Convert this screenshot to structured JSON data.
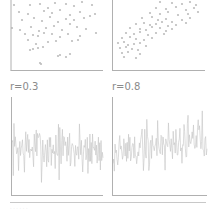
{
  "chart_data": [
    {
      "type": "scatter",
      "panel": "top-left",
      "title": "",
      "correlation_label": "r=0.3",
      "xlabel": "",
      "ylabel": "",
      "grid": false,
      "marker_color": "#bdbdbd",
      "axis_color": "#b0b0b0",
      "points": [
        [
          14,
          5
        ],
        [
          30,
          5
        ],
        [
          40,
          4
        ],
        [
          48,
          8
        ],
        [
          55,
          3
        ],
        [
          66,
          4
        ],
        [
          74,
          6
        ],
        [
          82,
          2
        ],
        [
          92,
          5
        ],
        [
          19,
          12
        ],
        [
          28,
          14
        ],
        [
          44,
          11
        ],
        [
          52,
          13
        ],
        [
          60,
          10
        ],
        [
          70,
          15
        ],
        [
          80,
          12
        ],
        [
          90,
          16
        ],
        [
          22,
          20
        ],
        [
          34,
          18
        ],
        [
          42,
          21
        ],
        [
          50,
          17
        ],
        [
          58,
          22
        ],
        [
          66,
          19
        ],
        [
          74,
          20
        ],
        [
          84,
          18
        ],
        [
          95,
          14
        ],
        [
          12,
          28
        ],
        [
          20,
          30
        ],
        [
          31,
          27
        ],
        [
          39,
          31
        ],
        [
          46,
          28
        ],
        [
          54,
          26
        ],
        [
          62,
          30
        ],
        [
          70,
          24
        ],
        [
          77,
          27
        ],
        [
          86,
          29
        ],
        [
          96,
          33
        ],
        [
          25,
          34
        ],
        [
          33,
          35
        ],
        [
          38,
          36
        ],
        [
          44,
          33
        ],
        [
          52,
          34
        ],
        [
          60,
          37
        ],
        [
          68,
          34
        ],
        [
          80,
          36
        ],
        [
          28,
          40
        ],
        [
          36,
          44
        ],
        [
          48,
          42
        ],
        [
          56,
          41
        ],
        [
          72,
          41
        ],
        [
          78,
          40
        ],
        [
          33,
          49
        ],
        [
          38,
          48
        ],
        [
          43,
          47
        ],
        [
          30,
          50
        ],
        [
          60,
          55
        ],
        [
          66,
          57
        ],
        [
          70,
          54
        ],
        [
          58,
          56
        ],
        [
          41,
          64
        ],
        [
          40,
          63
        ]
      ]
    },
    {
      "type": "scatter",
      "panel": "top-right",
      "title": "",
      "correlation_label": "r=0.8",
      "xlabel": "",
      "ylabel": "",
      "grid": false,
      "marker_color": "#bdbdbd",
      "axis_color": "#b0b0b0",
      "points": [
        [
          160,
          2
        ],
        [
          172,
          3
        ],
        [
          182,
          4
        ],
        [
          190,
          2
        ],
        [
          196,
          5
        ],
        [
          156,
          8
        ],
        [
          166,
          9
        ],
        [
          176,
          7
        ],
        [
          186,
          10
        ],
        [
          194,
          8
        ],
        [
          150,
          13
        ],
        [
          160,
          14
        ],
        [
          168,
          12
        ],
        [
          178,
          15
        ],
        [
          188,
          14
        ],
        [
          198,
          12
        ],
        [
          142,
          18
        ],
        [
          152,
          17
        ],
        [
          158,
          20
        ],
        [
          166,
          19
        ],
        [
          172,
          22
        ],
        [
          182,
          20
        ],
        [
          190,
          18
        ],
        [
          136,
          24
        ],
        [
          144,
          23
        ],
        [
          150,
          25
        ],
        [
          156,
          24
        ],
        [
          162,
          22
        ],
        [
          168,
          26
        ],
        [
          176,
          25
        ],
        [
          186,
          23
        ],
        [
          130,
          28
        ],
        [
          140,
          29
        ],
        [
          146,
          30
        ],
        [
          152,
          27
        ],
        [
          160,
          28
        ],
        [
          166,
          31
        ],
        [
          172,
          29
        ],
        [
          126,
          33
        ],
        [
          134,
          34
        ],
        [
          140,
          32
        ],
        [
          148,
          35
        ],
        [
          156,
          33
        ],
        [
          164,
          34
        ],
        [
          122,
          38
        ],
        [
          130,
          37
        ],
        [
          136,
          39
        ],
        [
          144,
          40
        ],
        [
          152,
          38
        ],
        [
          118,
          43
        ],
        [
          124,
          42
        ],
        [
          128,
          45
        ],
        [
          134,
          44
        ],
        [
          140,
          43
        ],
        [
          146,
          46
        ],
        [
          120,
          48
        ],
        [
          126,
          47
        ],
        [
          132,
          49
        ],
        [
          138,
          50
        ],
        [
          122,
          53
        ],
        [
          128,
          52
        ],
        [
          140,
          54
        ],
        [
          124,
          57
        ],
        [
          136,
          58
        ]
      ]
    },
    {
      "type": "line",
      "panel": "bottom-left",
      "title": "r=0.3",
      "xlabel": "",
      "ylabel": "",
      "grid": false,
      "line_color": "#c4c4c4",
      "axis_color": "#b0b0b0",
      "n_points": 140,
      "seed": 7,
      "baseline": 0.45,
      "amplitude": 0.42,
      "drift": 0.0
    },
    {
      "type": "line",
      "panel": "bottom-right",
      "title": "r=0.8",
      "xlabel": "",
      "ylabel": "",
      "grid": false,
      "line_color": "#c4c4c4",
      "axis_color": "#b0b0b0",
      "n_points": 140,
      "seed": 19,
      "baseline": 0.5,
      "amplitude": 0.4,
      "drift": 0.18
    }
  ],
  "labels": {
    "left": "r=0.3",
    "right": "r=0.8"
  },
  "footer": {
    "text": "· · · · · ·"
  }
}
